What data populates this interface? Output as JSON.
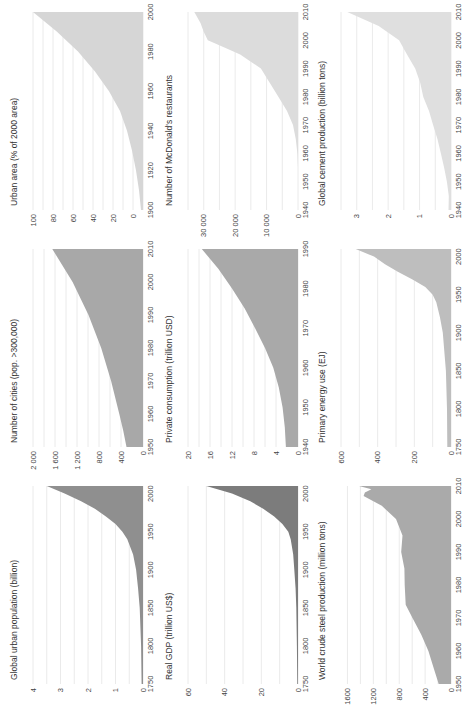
{
  "figure": {
    "orientation": "rotated-90-ccw",
    "panels_order": [
      "urban_pop",
      "cities",
      "urban_area",
      "gdp",
      "consumption",
      "mcdonalds",
      "steel",
      "energy",
      "cement"
    ]
  },
  "chart_data": [
    {
      "id": "urban_pop",
      "type": "area",
      "title": "Global urban population (billion)",
      "xlabel": "",
      "ylabel": "",
      "x_ticks": [
        1750,
        1800,
        1850,
        1900,
        1950,
        2000
      ],
      "y_ticks": [
        0,
        1,
        2,
        3,
        4
      ],
      "xlim": [
        1750,
        2010
      ],
      "ylim": [
        0,
        4
      ],
      "grid_step": 0.5,
      "fill": "#8f8f8f",
      "x": [
        1750,
        1800,
        1850,
        1875,
        1900,
        1920,
        1940,
        1950,
        1960,
        1970,
        1980,
        1990,
        2000,
        2010
      ],
      "values": [
        0.05,
        0.07,
        0.12,
        0.18,
        0.25,
        0.36,
        0.57,
        0.75,
        1.0,
        1.35,
        1.75,
        2.25,
        2.85,
        3.5
      ]
    },
    {
      "id": "cities",
      "type": "area",
      "title": "Number of cities (pop. >300,000)",
      "xlabel": "",
      "ylabel": "",
      "x_ticks": [
        1950,
        1960,
        1970,
        1980,
        1990,
        2000,
        2010
      ],
      "y_ticks": [
        0,
        400,
        800,
        1200,
        1600,
        2000
      ],
      "y_tick_labels": [
        "0",
        "400",
        "800",
        "1 200",
        "1 600",
        "2 000"
      ],
      "xlim": [
        1950,
        2010
      ],
      "ylim": [
        0,
        2000
      ],
      "grid_step": 200,
      "fill": "#a8a8a8",
      "x": [
        1950,
        1955,
        1960,
        1970,
        1980,
        1990,
        2000,
        2010
      ],
      "values": [
        300,
        360,
        430,
        580,
        760,
        990,
        1280,
        1650
      ]
    },
    {
      "id": "urban_area",
      "type": "area",
      "title": "Urban area (% of 2000 area)",
      "xlabel": "",
      "ylabel": "",
      "x_ticks": [
        1900,
        1920,
        1940,
        1960,
        1980,
        2000
      ],
      "y_ticks": [
        0,
        20,
        40,
        60,
        80,
        100
      ],
      "xlim": [
        1900,
        2000
      ],
      "ylim": [
        -10,
        100
      ],
      "grid_step": 10,
      "fill": "#d6d6d6",
      "x": [
        1900,
        1910,
        1920,
        1930,
        1940,
        1950,
        1960,
        1970,
        1980,
        1990,
        2000
      ],
      "values": [
        -8,
        -6,
        -3,
        1,
        6,
        13,
        24,
        38,
        55,
        76,
        100
      ]
    },
    {
      "id": "gdp",
      "type": "area",
      "title": "Real GDP (trillion US$)",
      "xlabel": "",
      "ylabel": "",
      "x_ticks": [
        1750,
        1800,
        1850,
        1900,
        1950,
        2000
      ],
      "y_ticks": [
        0,
        20,
        40,
        60
      ],
      "xlim": [
        1750,
        2010
      ],
      "ylim": [
        0,
        60
      ],
      "grid_step": 10,
      "fill": "#7c7c7c",
      "x": [
        1750,
        1800,
        1850,
        1875,
        1900,
        1920,
        1940,
        1950,
        1960,
        1970,
        1980,
        1990,
        2000,
        2010
      ],
      "values": [
        0.4,
        0.6,
        0.9,
        1.3,
        2,
        2.6,
        4,
        5.3,
        8.5,
        13,
        19,
        26,
        36,
        50
      ]
    },
    {
      "id": "consumption",
      "type": "area",
      "title": "Private consumption (trillion USD)",
      "xlabel": "",
      "ylabel": "",
      "x_ticks": [
        1940,
        1950,
        1960,
        1970,
        1980,
        1990
      ],
      "y_ticks": [
        0,
        4,
        8,
        12,
        16,
        20
      ],
      "xlim": [
        1940,
        1990
      ],
      "ylim": [
        0,
        20
      ],
      "grid_step": 2,
      "fill": "#a9a9a9",
      "x": [
        1940,
        1945,
        1950,
        1955,
        1960,
        1965,
        1970,
        1975,
        1980,
        1985,
        1990
      ],
      "values": [
        2.2,
        2.4,
        2.8,
        3.5,
        4.5,
        6.0,
        7.8,
        9.7,
        12.0,
        14.5,
        17.5
      ]
    },
    {
      "id": "mcdonalds",
      "type": "area",
      "title": "Number of McDonald's restaurants",
      "xlabel": "",
      "ylabel": "",
      "x_ticks": [
        1940,
        1950,
        1960,
        1970,
        1980,
        1990,
        2000,
        2010
      ],
      "y_ticks": [
        0,
        10000,
        20000,
        30000
      ],
      "y_tick_labels": [
        "0",
        "10 000",
        "20 000",
        "30 000"
      ],
      "xlim": [
        1940,
        2010
      ],
      "ylim": [
        0,
        35000
      ],
      "grid_step": 5000,
      "fill": "#dcdcdc",
      "x": [
        1940,
        1955,
        1960,
        1965,
        1970,
        1975,
        1980,
        1985,
        1990,
        1995,
        1998,
        2000,
        2003,
        2006,
        2010
      ],
      "values": [
        0,
        0,
        200,
        700,
        1600,
        3500,
        6200,
        9000,
        11800,
        18400,
        24500,
        28700,
        30000,
        31000,
        33000
      ]
    },
    {
      "id": "steel",
      "type": "area",
      "title": "World crude steel production (million tons)",
      "xlabel": "",
      "ylabel": "",
      "x_ticks": [
        1950,
        1960,
        1970,
        1980,
        1990,
        2000,
        2010
      ],
      "y_ticks": [
        0,
        400,
        800,
        1200,
        1600
      ],
      "xlim": [
        1950,
        2010
      ],
      "ylim": [
        0,
        1700
      ],
      "grid_step": 200,
      "fill": "#aaaaaa",
      "x": [
        1950,
        1955,
        1960,
        1965,
        1970,
        1974,
        1980,
        1985,
        1990,
        1995,
        2000,
        2004,
        2007,
        2008,
        2009,
        2010
      ],
      "values": [
        190,
        270,
        350,
        460,
        595,
        700,
        715,
        720,
        770,
        750,
        850,
        1070,
        1350,
        1330,
        1230,
        1420
      ]
    },
    {
      "id": "energy",
      "type": "area",
      "title": "Primary energy use (EJ)",
      "xlabel": "",
      "ylabel": "",
      "x_ticks": [
        1750,
        1800,
        1850,
        1900,
        1950,
        2000
      ],
      "y_ticks": [
        0,
        200,
        400,
        600
      ],
      "xlim": [
        1750,
        2010
      ],
      "ylim": [
        0,
        600
      ],
      "grid_step": 100,
      "fill": "#bebebe",
      "x": [
        1750,
        1800,
        1850,
        1900,
        1920,
        1940,
        1950,
        1960,
        1970,
        1980,
        1990,
        2000,
        2010
      ],
      "values": [
        20,
        22,
        28,
        45,
        60,
        80,
        100,
        140,
        210,
        290,
        360,
        420,
        520
      ]
    },
    {
      "id": "cement",
      "type": "area",
      "title": "Global cement production (billion tons)",
      "xlabel": "",
      "ylabel": "",
      "x_ticks": [
        1940,
        1950,
        1960,
        1970,
        1980,
        1990,
        2000,
        2010
      ],
      "y_ticks": [
        0,
        1,
        2,
        3
      ],
      "xlim": [
        1940,
        2010
      ],
      "ylim": [
        0,
        3.5
      ],
      "grid_step": 0.5,
      "fill": "#dfdfdf",
      "x": [
        1940,
        1945,
        1950,
        1955,
        1960,
        1965,
        1970,
        1975,
        1980,
        1985,
        1990,
        1995,
        2000,
        2005,
        2010
      ],
      "values": [
        0.08,
        0.07,
        0.13,
        0.22,
        0.32,
        0.43,
        0.57,
        0.7,
        0.88,
        0.98,
        1.14,
        1.4,
        1.65,
        2.3,
        3.3
      ]
    }
  ]
}
